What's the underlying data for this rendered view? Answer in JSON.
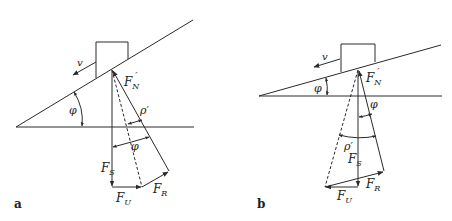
{
  "panels": [
    {
      "id": "a",
      "panel_label": "a",
      "labels": {
        "velocity": "v",
        "normal_force": "F",
        "normal_force_sub": "N",
        "normal_force_prime": "′",
        "friction_angle": "ρ′",
        "incline_angle_left": "φ",
        "incline_angle_vector": "φ",
        "weight_force": "F",
        "weight_force_sub": "S",
        "push_force": "F",
        "push_force_sub": "U",
        "friction_force": "F",
        "friction_force_sub": "R"
      }
    },
    {
      "id": "b",
      "panel_label": "b",
      "labels": {
        "velocity": "v",
        "normal_force": "F",
        "normal_force_sub": "N",
        "normal_force_prime": "′",
        "friction_angle": "ρ′",
        "incline_angle_left": "φ",
        "incline_angle_vector": "φ",
        "weight_force": "F",
        "weight_force_sub": "S",
        "push_force": "F",
        "push_force_sub": "U",
        "friction_force": "F",
        "friction_force_sub": "R"
      }
    }
  ],
  "colors": {
    "stroke": "#2a2a2a",
    "background": "#ffffff"
  }
}
